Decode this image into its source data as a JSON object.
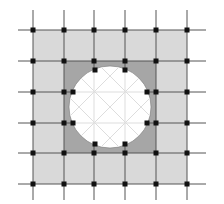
{
  "diagram": {
    "title": "",
    "grid": {
      "xs": [
        33,
        64,
        94,
        125,
        156,
        187
      ],
      "ys": [
        30,
        61,
        92,
        123,
        153,
        184
      ],
      "line_extent": {
        "x0": 18,
        "x1": 206,
        "y0": 10,
        "y1": 200
      }
    },
    "outer_square": {
      "x": 33,
      "y": 30,
      "w": 154,
      "h": 154
    },
    "inner_square": {
      "x": 64,
      "y": 61,
      "w": 92,
      "h": 92
    },
    "circle": {
      "cx": 110,
      "cy": 107,
      "r": 41
    },
    "circle_points": [
      [
        95,
        70
      ],
      [
        125,
        70
      ],
      [
        73,
        92
      ],
      [
        147,
        92
      ],
      [
        73,
        123
      ],
      [
        147,
        123
      ],
      [
        95,
        144
      ],
      [
        125,
        144
      ]
    ],
    "colors": {
      "light_fill": "#d9d9d9",
      "dark_fill": "#a6a6a6",
      "circle_fill": "#ffffff",
      "grid_line": "#555555",
      "inner_line": "#dddddd",
      "node": "#111111"
    }
  }
}
